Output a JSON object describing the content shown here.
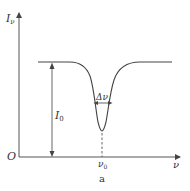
{
  "figure": {
    "caption": "a",
    "y_axis_label": "I",
    "y_axis_label_sub": "ν",
    "origin_label": "O",
    "x_axis_label": "ν",
    "baseline_label": "I",
    "baseline_label_sub": "0",
    "width_label": "Δν",
    "center_label": "ν",
    "center_label_sub": "0",
    "line_color": "#555555",
    "curve_color": "#444444"
  }
}
